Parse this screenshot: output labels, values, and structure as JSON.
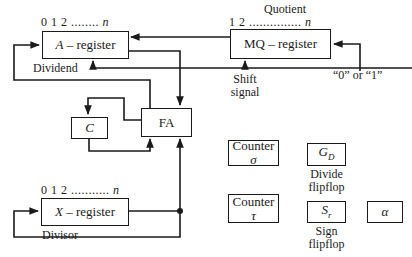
{
  "diagram": {
    "registers": {
      "a": {
        "name": "A",
        "suffix": " – register",
        "bits": "0 1 2 ........ ",
        "bits_end": "n",
        "role": "Dividend"
      },
      "mq": {
        "name": "MQ – register",
        "bits": "1 2 ............... ",
        "bits_end": "n",
        "role": "Quotient"
      },
      "x": {
        "name": "X",
        "suffix": " – register",
        "bits": "0 1 2 ........... ",
        "bits_end": "n",
        "role": "Divisor"
      }
    },
    "fa": {
      "label": "FA"
    },
    "carry": {
      "label": "C"
    },
    "shift_signal": {
      "line1": "Shift",
      "line2": "signal"
    },
    "mq_input": {
      "label": "“0” or “1”"
    },
    "counters": [
      {
        "line1": "Counter",
        "line2": "σ"
      },
      {
        "line1": "Counter",
        "line2": "τ"
      }
    ],
    "flipflops": [
      {
        "symbol": "G",
        "sub": "D",
        "caption1": "Divide",
        "caption2": "flipflop"
      },
      {
        "symbol": "S",
        "sub": "r",
        "caption1": "Sign",
        "caption2": "flipflop"
      }
    ],
    "alpha": {
      "label": "α"
    },
    "colors": {
      "line": "#1a1a1a",
      "background": "#ffffff"
    }
  }
}
